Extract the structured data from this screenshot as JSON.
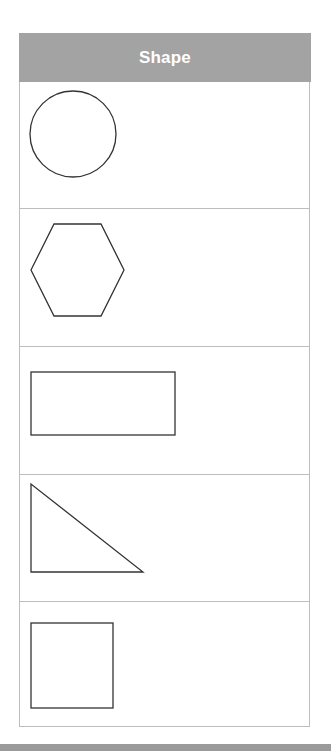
{
  "table": {
    "header": "Shape",
    "rows": [
      {
        "shape": "circle"
      },
      {
        "shape": "hexagon"
      },
      {
        "shape": "rectangle"
      },
      {
        "shape": "triangle"
      },
      {
        "shape": "square"
      }
    ]
  },
  "colors": {
    "header_bg": "#a3a3a3",
    "header_text": "#ffffff",
    "border": "#bdbdbd",
    "shape_stroke": "#333333"
  }
}
